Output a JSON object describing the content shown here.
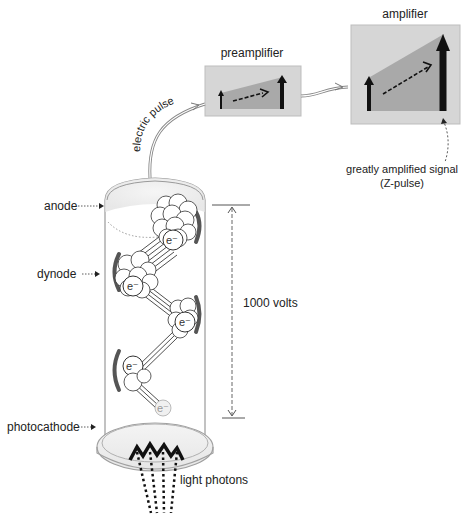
{
  "labels": {
    "amplifier": "amplifier",
    "preamplifier": "preamplifier",
    "electric_pulse": "electric pulse",
    "greatly_amplified_line1": "greatly amplified signal",
    "greatly_amplified_line2": "(Z-pulse)",
    "anode": "anode",
    "dynode": "dynode",
    "voltage": "1000 volts",
    "photocathode": "photocathode",
    "light_photons": "light photons",
    "electron": "e⁻"
  },
  "colors": {
    "box_bg": "#d6d6d6",
    "box_fill": "#a8a8a8",
    "arrow": "#111111",
    "tube_stroke": "#9a9a9a",
    "dynode": "#555555"
  },
  "electron_labels": [
    "e⁻",
    "e⁻",
    "e⁻",
    "e⁻",
    "e⁻"
  ]
}
